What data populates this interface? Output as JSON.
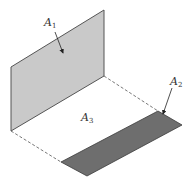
{
  "figure": {
    "background": "#ffffff"
  },
  "surfaces": {
    "A1": {
      "label_main": "A",
      "label_sub": "1",
      "fill": "#c9c9c9",
      "stroke": "#555555",
      "points": "11,67 104,10 104,76 11,131"
    },
    "A2": {
      "label_main": "A",
      "label_sub": "2",
      "fill": "#6e6e6e",
      "stroke": "#3a3a3a",
      "points": "158,111 182,125 87,176 61,162"
    },
    "A3": {
      "label_main": "A",
      "label_sub": "3"
    }
  },
  "dashed_edges": [
    {
      "x1": 11,
      "y1": 131,
      "x2": 61,
      "y2": 162
    },
    {
      "x1": 104,
      "y1": 76,
      "x2": 158,
      "y2": 111
    }
  ],
  "arrows": {
    "A1": {
      "x1": 55,
      "y1": 32,
      "x2": 63,
      "y2": 53
    },
    "A2": {
      "x1": 172,
      "y1": 88,
      "x2": 163,
      "y2": 114
    }
  },
  "label_positions": {
    "A1": {
      "x": 44,
      "y": 26
    },
    "A2": {
      "x": 170,
      "y": 85
    },
    "A3": {
      "x": 81,
      "y": 121
    }
  },
  "colors": {
    "line": "#444444",
    "dashed": "#555555",
    "arrow": "#222222"
  }
}
